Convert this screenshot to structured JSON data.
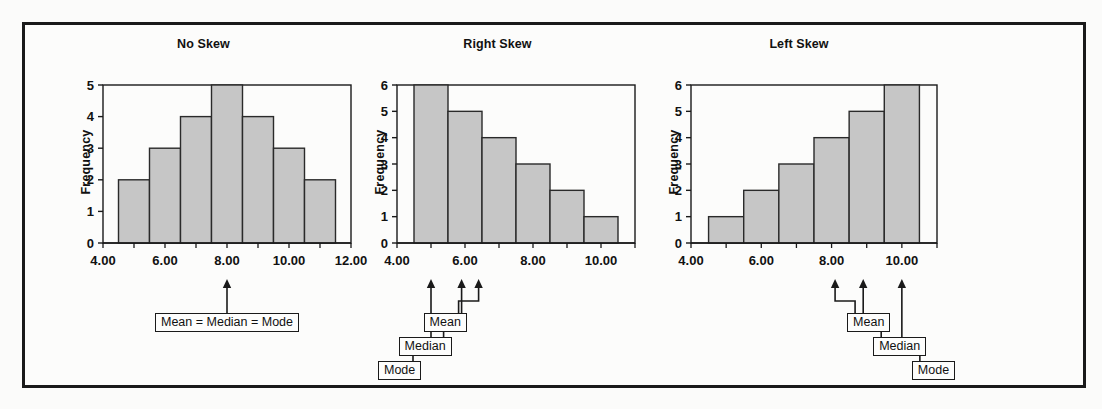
{
  "figure": {
    "background_color": "#fcfcfb",
    "frame_color": "#1a1a1a",
    "bar_fill_color": "#c6c6c6",
    "bar_stroke_color": "#2a2a2a",
    "text_color": "#111111"
  },
  "panels": [
    {
      "id": "no-skew",
      "title": "No Skew",
      "y_axis_label": "Frequency",
      "annotations": [
        {
          "label": "Mean = Median = Mode",
          "value": 8.0
        }
      ]
    },
    {
      "id": "right-skew",
      "title": "Right Skew",
      "y_axis_label": "Frequency",
      "annotations": [
        {
          "label": "Mode",
          "value": 5.0
        },
        {
          "label": "Median",
          "value": 5.9
        },
        {
          "label": "Mean",
          "value": 6.4
        }
      ]
    },
    {
      "id": "left-skew",
      "title": "Left Skew",
      "y_axis_label": "Frequency",
      "annotations": [
        {
          "label": "Mean",
          "value": 8.1
        },
        {
          "label": "Median",
          "value": 8.9
        },
        {
          "label": "Mode",
          "value": 10.0
        }
      ]
    }
  ],
  "chart_data": [
    {
      "type": "bar",
      "title": "No Skew",
      "xlabel": "",
      "ylabel": "Frequency",
      "categories": [
        "5.00",
        "6.00",
        "7.00",
        "8.00",
        "9.00",
        "10.00",
        "11.00"
      ],
      "bin_centers": [
        5,
        6,
        7,
        8,
        9,
        10,
        11
      ],
      "bin_width": 1,
      "values": [
        2,
        3,
        4,
        5,
        4,
        3,
        2
      ],
      "xlim": [
        4.0,
        12.0
      ],
      "ylim": [
        0,
        5
      ],
      "xticks": [
        "4.00",
        "6.00",
        "8.00",
        "10.00",
        "12.00"
      ],
      "xtick_values": [
        4,
        6,
        8,
        10,
        12
      ],
      "yticks": [
        "0",
        "1",
        "2",
        "3",
        "4",
        "5"
      ],
      "ytick_values": [
        0,
        1,
        2,
        3,
        4,
        5
      ],
      "grid": false,
      "legend": "none",
      "annotations": [
        {
          "text": "Mean = Median = Mode",
          "x": 8.0
        }
      ]
    },
    {
      "type": "bar",
      "title": "Right Skew",
      "xlabel": "",
      "ylabel": "Frequency",
      "categories": [
        "5.00",
        "6.00",
        "7.00",
        "8.00",
        "9.00",
        "10.00"
      ],
      "bin_centers": [
        5,
        6,
        7,
        8,
        9,
        10
      ],
      "bin_width": 1,
      "values": [
        6,
        5,
        4,
        3,
        2,
        1
      ],
      "xlim": [
        4.0,
        11.0
      ],
      "ylim": [
        0,
        6
      ],
      "xticks": [
        "4.00",
        "6.00",
        "8.00",
        "10.00"
      ],
      "xtick_values": [
        4,
        6,
        8,
        10
      ],
      "yticks": [
        "0",
        "1",
        "2",
        "3",
        "4",
        "5",
        "6"
      ],
      "ytick_values": [
        0,
        1,
        2,
        3,
        4,
        5,
        6
      ],
      "grid": false,
      "legend": "none",
      "annotations": [
        {
          "text": "Mode",
          "x": 5.0
        },
        {
          "text": "Median",
          "x": 5.9
        },
        {
          "text": "Mean",
          "x": 6.4
        }
      ]
    },
    {
      "type": "bar",
      "title": "Left Skew",
      "xlabel": "",
      "ylabel": "Frequency",
      "categories": [
        "5.00",
        "6.00",
        "7.00",
        "8.00",
        "9.00",
        "10.00"
      ],
      "bin_centers": [
        5,
        6,
        7,
        8,
        9,
        10
      ],
      "bin_width": 1,
      "values": [
        1,
        2,
        3,
        4,
        5,
        6
      ],
      "xlim": [
        4.0,
        11.0
      ],
      "ylim": [
        0,
        6
      ],
      "xticks": [
        "4.00",
        "6.00",
        "8.00",
        "10.00"
      ],
      "xtick_values": [
        4,
        6,
        8,
        10
      ],
      "yticks": [
        "0",
        "1",
        "2",
        "3",
        "4",
        "5",
        "6"
      ],
      "ytick_values": [
        0,
        1,
        2,
        3,
        4,
        5,
        6
      ],
      "grid": false,
      "legend": "none",
      "annotations": [
        {
          "text": "Mean",
          "x": 8.1
        },
        {
          "text": "Median",
          "x": 8.9
        },
        {
          "text": "Mode",
          "x": 10.0
        }
      ]
    }
  ]
}
